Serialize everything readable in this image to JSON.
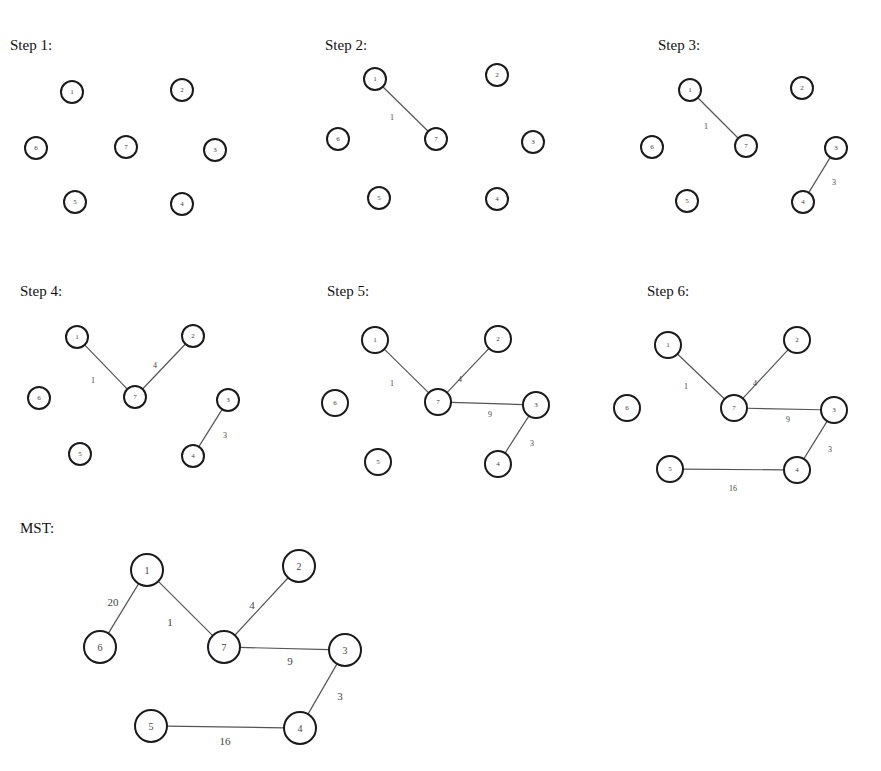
{
  "panels": [
    {
      "id": "step1",
      "title": "Step 1:",
      "title_pos": [
        10,
        50
      ],
      "size": "sm",
      "nodes": [
        {
          "id": "1",
          "x": 72,
          "y": 92
        },
        {
          "id": "2",
          "x": 182,
          "y": 90
        },
        {
          "id": "6",
          "x": 36,
          "y": 148
        },
        {
          "id": "7",
          "x": 126,
          "y": 147
        },
        {
          "id": "3",
          "x": 215,
          "y": 150
        },
        {
          "id": "5",
          "x": 75,
          "y": 202
        },
        {
          "id": "4",
          "x": 182,
          "y": 204
        }
      ],
      "edges": []
    },
    {
      "id": "step2",
      "title": "Step 2:",
      "title_pos": [
        325,
        50
      ],
      "size": "sm",
      "nodes": [
        {
          "id": "1",
          "x": 375,
          "y": 79
        },
        {
          "id": "2",
          "x": 497,
          "y": 75
        },
        {
          "id": "6",
          "x": 338,
          "y": 139
        },
        {
          "id": "7",
          "x": 436,
          "y": 139
        },
        {
          "id": "3",
          "x": 533,
          "y": 142
        },
        {
          "id": "5",
          "x": 379,
          "y": 198
        },
        {
          "id": "4",
          "x": 497,
          "y": 199
        }
      ],
      "edges": [
        {
          "from": "1",
          "to": "7",
          "weight": "1",
          "lx": 392,
          "ly": 117
        }
      ]
    },
    {
      "id": "step3",
      "title": "Step 3:",
      "title_pos": [
        658,
        50
      ],
      "size": "sm",
      "nodes": [
        {
          "id": "1",
          "x": 690,
          "y": 90
        },
        {
          "id": "2",
          "x": 802,
          "y": 88
        },
        {
          "id": "6",
          "x": 652,
          "y": 147
        },
        {
          "id": "7",
          "x": 746,
          "y": 146
        },
        {
          "id": "3",
          "x": 836,
          "y": 148
        },
        {
          "id": "5",
          "x": 687,
          "y": 201
        },
        {
          "id": "4",
          "x": 803,
          "y": 202
        }
      ],
      "edges": [
        {
          "from": "1",
          "to": "7",
          "weight": "1",
          "lx": 706,
          "ly": 126
        },
        {
          "from": "3",
          "to": "4",
          "weight": "3",
          "lx": 834,
          "ly": 182
        }
      ]
    },
    {
      "id": "step4",
      "title": "Step 4:",
      "title_pos": [
        20,
        296
      ],
      "size": "sm",
      "nodes": [
        {
          "id": "1",
          "x": 77,
          "y": 337
        },
        {
          "id": "2",
          "x": 193,
          "y": 336
        },
        {
          "id": "6",
          "x": 39,
          "y": 398
        },
        {
          "id": "7",
          "x": 135,
          "y": 397
        },
        {
          "id": "3",
          "x": 228,
          "y": 400
        },
        {
          "id": "5",
          "x": 80,
          "y": 454
        },
        {
          "id": "4",
          "x": 193,
          "y": 456
        }
      ],
      "edges": [
        {
          "from": "1",
          "to": "7",
          "weight": "1",
          "lx": 93,
          "ly": 380
        },
        {
          "from": "7",
          "to": "2",
          "weight": "4",
          "lx": 155,
          "ly": 365
        },
        {
          "from": "3",
          "to": "4",
          "weight": "3",
          "lx": 225,
          "ly": 435
        }
      ]
    },
    {
      "id": "step5",
      "title": "Step 5:",
      "title_pos": [
        327,
        296
      ],
      "size": "md",
      "nodes": [
        {
          "id": "1",
          "x": 375,
          "y": 340
        },
        {
          "id": "2",
          "x": 498,
          "y": 339
        },
        {
          "id": "6",
          "x": 335,
          "y": 403
        },
        {
          "id": "7",
          "x": 438,
          "y": 402
        },
        {
          "id": "3",
          "x": 536,
          "y": 405
        },
        {
          "id": "5",
          "x": 378,
          "y": 462
        },
        {
          "id": "4",
          "x": 498,
          "y": 464
        }
      ],
      "edges": [
        {
          "from": "1",
          "to": "7",
          "weight": "1",
          "lx": 392,
          "ly": 383
        },
        {
          "from": "7",
          "to": "2",
          "weight": "4",
          "lx": 460,
          "ly": 379
        },
        {
          "from": "7",
          "to": "3",
          "weight": "9",
          "lx": 490,
          "ly": 414
        },
        {
          "from": "3",
          "to": "4",
          "weight": "3",
          "lx": 532,
          "ly": 443
        }
      ]
    },
    {
      "id": "step6",
      "title": "Step 6:",
      "title_pos": [
        647,
        296
      ],
      "size": "md",
      "nodes": [
        {
          "id": "1",
          "x": 668,
          "y": 345
        },
        {
          "id": "2",
          "x": 797,
          "y": 340
        },
        {
          "id": "6",
          "x": 627,
          "y": 408
        },
        {
          "id": "7",
          "x": 734,
          "y": 408
        },
        {
          "id": "3",
          "x": 834,
          "y": 410
        },
        {
          "id": "5",
          "x": 670,
          "y": 469
        },
        {
          "id": "4",
          "x": 797,
          "y": 470
        }
      ],
      "edges": [
        {
          "from": "1",
          "to": "7",
          "weight": "1",
          "lx": 686,
          "ly": 386
        },
        {
          "from": "7",
          "to": "2",
          "weight": "4",
          "lx": 755,
          "ly": 383
        },
        {
          "from": "7",
          "to": "3",
          "weight": "9",
          "lx": 788,
          "ly": 419
        },
        {
          "from": "3",
          "to": "4",
          "weight": "3",
          "lx": 830,
          "ly": 449
        },
        {
          "from": "5",
          "to": "4",
          "weight": "16",
          "lx": 733,
          "ly": 488
        }
      ]
    },
    {
      "id": "mst",
      "title": "MST:",
      "title_pos": [
        20,
        533
      ],
      "size": "lg",
      "nodes": [
        {
          "id": "1",
          "x": 147,
          "y": 570
        },
        {
          "id": "2",
          "x": 299,
          "y": 566
        },
        {
          "id": "6",
          "x": 100,
          "y": 647
        },
        {
          "id": "7",
          "x": 224,
          "y": 647
        },
        {
          "id": "3",
          "x": 345,
          "y": 650
        },
        {
          "id": "5",
          "x": 151,
          "y": 726
        },
        {
          "id": "4",
          "x": 300,
          "y": 728
        }
      ],
      "edges": [
        {
          "from": "1",
          "to": "6",
          "weight": "20",
          "lx": 113,
          "ly": 602
        },
        {
          "from": "1",
          "to": "7",
          "weight": "1",
          "lx": 170,
          "ly": 622
        },
        {
          "from": "7",
          "to": "2",
          "weight": "4",
          "lx": 252,
          "ly": 605
        },
        {
          "from": "7",
          "to": "3",
          "weight": "9",
          "lx": 290,
          "ly": 661
        },
        {
          "from": "3",
          "to": "4",
          "weight": "3",
          "lx": 340,
          "ly": 696
        },
        {
          "from": "5",
          "to": "4",
          "weight": "16",
          "lx": 225,
          "ly": 741
        }
      ]
    }
  ]
}
